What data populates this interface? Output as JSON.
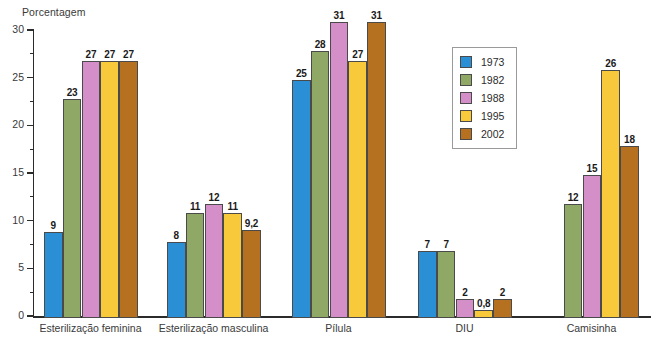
{
  "chart_data": {
    "type": "bar",
    "title": "",
    "subtitle": "",
    "xlabel": "",
    "ylabel": "Porcentagem",
    "ylim": [
      0,
      30
    ],
    "ytick_labels": [
      "0",
      "5",
      "10",
      "15",
      "20",
      "25",
      "30"
    ],
    "yticks": [
      0,
      5,
      10,
      15,
      20,
      25,
      30
    ],
    "minor_tick_step": 2.5,
    "grid": false,
    "legend_position": "upper-right-inside",
    "categories": [
      "Esterilização feminina",
      "Esterilização masculina",
      "Pílula",
      "DIU",
      "Camisinha"
    ],
    "series": [
      {
        "name": "1973",
        "color": "#2a8fd4",
        "values": [
          9,
          8,
          25,
          7,
          null
        ],
        "labels": [
          "9",
          "8",
          "25",
          "7",
          ""
        ]
      },
      {
        "name": "1982",
        "color": "#8fa866",
        "values": [
          23,
          11,
          28,
          7,
          12
        ],
        "labels": [
          "23",
          "11",
          "28",
          "7",
          "12"
        ]
      },
      {
        "name": "1988",
        "color": "#d48fc8",
        "values": [
          27,
          12,
          31,
          2,
          15
        ],
        "labels": [
          "27",
          "12",
          "31",
          "2",
          "15"
        ]
      },
      {
        "name": "1995",
        "color": "#f8c93a",
        "values": [
          27,
          11,
          27,
          0.8,
          26
        ],
        "labels": [
          "27",
          "11",
          "27",
          "0,8",
          "26"
        ]
      },
      {
        "name": "2002",
        "color": "#b5711f",
        "values": [
          27,
          9.2,
          31,
          2,
          18
        ],
        "labels": [
          "27",
          "9,2",
          "31",
          "2",
          "18"
        ]
      }
    ]
  },
  "legend": {
    "entries": [
      {
        "label": "1973",
        "color": "#2a8fd4"
      },
      {
        "label": "1982",
        "color": "#8fa866"
      },
      {
        "label": "1988",
        "color": "#d48fc8"
      },
      {
        "label": "1995",
        "color": "#f8c93a"
      },
      {
        "label": "2002",
        "color": "#b5711f"
      }
    ]
  },
  "axis": {
    "y_title": "Porcentagem"
  },
  "colors": {
    "axis": "#2b2b2b",
    "bar_outline": "#4a4a4a",
    "text": "#3a3a3a",
    "background": "#ffffff"
  }
}
